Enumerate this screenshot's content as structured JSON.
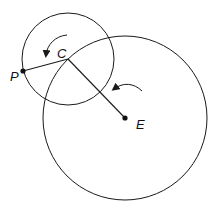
{
  "diagram": {
    "labels": {
      "P": "P",
      "C": "C",
      "E": "E"
    },
    "small_circle": {
      "cx": 68,
      "cy": 59,
      "r": 46
    },
    "large_circle": {
      "cx": 125,
      "cy": 118,
      "r": 82
    },
    "points": {
      "P": {
        "x": 23,
        "y": 71
      },
      "C": {
        "x": 68,
        "y": 59
      },
      "E": {
        "x": 125,
        "y": 118
      }
    },
    "segments": [
      [
        "P",
        "C"
      ],
      [
        "C",
        "E"
      ]
    ],
    "rotation_arrows": [
      {
        "near": "C",
        "direction": "counterclockwise"
      },
      {
        "near": "E",
        "direction": "counterclockwise"
      }
    ],
    "stroke_color": "#1a1a1a"
  }
}
